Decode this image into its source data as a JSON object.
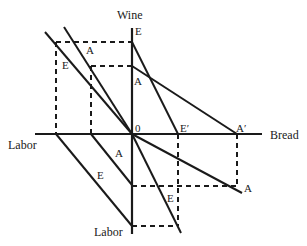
{
  "diagram": {
    "type": "four-quadrant trade diagram",
    "axes": {
      "vertical_top": "Wine",
      "vertical_bottom": "Labor",
      "horizontal_left": "Labor",
      "horizontal_right": "Bread",
      "origin": "0"
    },
    "line_labels": {
      "ul_A": "A",
      "ul_E": "E",
      "ur_E": "E",
      "ur_A": "A",
      "axis_E_prime": "E′",
      "axis_A_prime": "A′",
      "ll_A": "A",
      "ll_E": "E",
      "lr_E": "E",
      "lr_A": "A"
    },
    "colors": {
      "line": "#1a1a1a",
      "background": "#ffffff"
    }
  }
}
